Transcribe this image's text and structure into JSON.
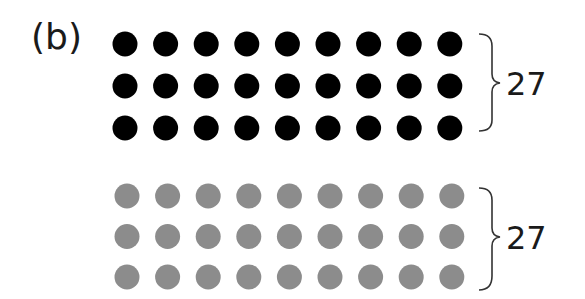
{
  "label": "(b)",
  "groups": [
    {
      "name": "black-group",
      "rows": 3,
      "cols": 9,
      "color": "#000000",
      "count_label": "27"
    },
    {
      "name": "gray-group",
      "rows": 3,
      "cols": 9,
      "color": "#8c8c8c",
      "count_label": "27"
    }
  ]
}
